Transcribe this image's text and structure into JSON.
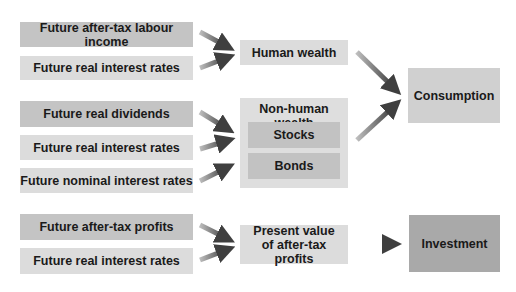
{
  "diagram": {
    "inputs": {
      "human": [
        {
          "label": "Future after-tax labour income"
        },
        {
          "label": "Future real interest rates"
        }
      ],
      "nonhuman": [
        {
          "label": "Future real dividends"
        },
        {
          "label": "Future real interest rates"
        },
        {
          "label": "Future nominal interest rates"
        }
      ],
      "profits": [
        {
          "label": "Future after-tax profits"
        },
        {
          "label": "Future real interest rates"
        }
      ]
    },
    "intermediate": {
      "human_wealth": "Human wealth",
      "nonhuman_wealth": {
        "title": "Non-human wealth",
        "items": [
          "Stocks",
          "Bonds"
        ]
      },
      "present_value": "Present value of after-tax profits"
    },
    "outputs": {
      "consumption": "Consumption",
      "investment": "Investment"
    },
    "colors": {
      "dark_box": "#c4c4c4",
      "light_box": "#dcdcdc",
      "output_investment": "#a9a9a9",
      "arrow": "#555555"
    }
  }
}
